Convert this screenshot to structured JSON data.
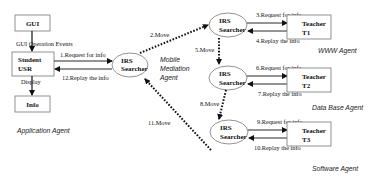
{
  "diagram": {
    "nodes": {
      "gui": {
        "label": "GUI"
      },
      "student": {
        "line1": "Student",
        "line2": "USR"
      },
      "info": {
        "label": "Info"
      },
      "searcher_mobile": {
        "line1": "IRS",
        "line2": "Searcher"
      },
      "searcher_www": {
        "line1": "IRS",
        "line2": "Searcher"
      },
      "searcher_db": {
        "line1": "IRS",
        "line2": "Searcher"
      },
      "searcher_sw": {
        "line1": "IRS",
        "line2": "Searcher"
      },
      "teacher1": {
        "line1": "Teacher",
        "line2": "T1"
      },
      "teacher2": {
        "line1": "Teacher",
        "line2": "T2"
      },
      "teacher3": {
        "line1": "Teacher",
        "line2": "T3"
      }
    },
    "edges": {
      "gui_events": "GUI  Operation Events",
      "display": "Display",
      "e1": "1.Request for info",
      "e12": "12.Replay the info",
      "e2": "2.Move",
      "e3": "3.Request for info",
      "e4": "4.Replay the info",
      "e5": "5.Move",
      "e6": "6.Request for info",
      "e7": "7.Replay the info",
      "e8": "8.Move",
      "e9": "9.Request for info",
      "e10": "10.Replay the info",
      "e11": "11.Move"
    },
    "agents": {
      "application": "Application Agent",
      "mobile_line1": "Mobile",
      "mobile_line2": "Mediation",
      "mobile_line3": "Agent",
      "www": "WWW Agent",
      "database": "Data Base Agent",
      "software": "Software Agent"
    },
    "colors": {
      "line": "#111111",
      "box_border": "#666666",
      "ellipse_border": "#666666"
    }
  }
}
